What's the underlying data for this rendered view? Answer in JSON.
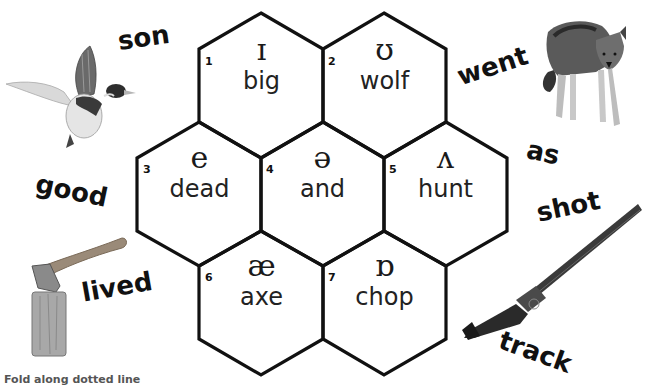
{
  "hexagons": [
    {
      "number": "1",
      "symbol": "ɪ",
      "word": "big"
    },
    {
      "number": "2",
      "symbol": "ʊ",
      "word": "wolf"
    },
    {
      "number": "3",
      "symbol": "e",
      "word": "dead"
    },
    {
      "number": "4",
      "symbol": "ə",
      "word": "and"
    },
    {
      "number": "5",
      "symbol": "ʌ",
      "word": "hunt"
    },
    {
      "number": "6",
      "symbol": "æ",
      "word": "axe"
    },
    {
      "number": "7",
      "symbol": "ɒ",
      "word": "chop"
    }
  ],
  "outer_words": {
    "son": "son",
    "good": "good",
    "lived": "lived",
    "went": "went",
    "as": "as",
    "shot": "shot",
    "track": "track"
  },
  "images": {
    "duck": "duck-image",
    "axe": "axe-in-log-image",
    "wolf": "wolf-image",
    "shotgun": "shotgun-image"
  },
  "footer": {
    "instruction": "Fold along dotted line"
  },
  "colors": {
    "outline": "#111111",
    "background": "#ffffff",
    "footer_text": "#555555"
  }
}
